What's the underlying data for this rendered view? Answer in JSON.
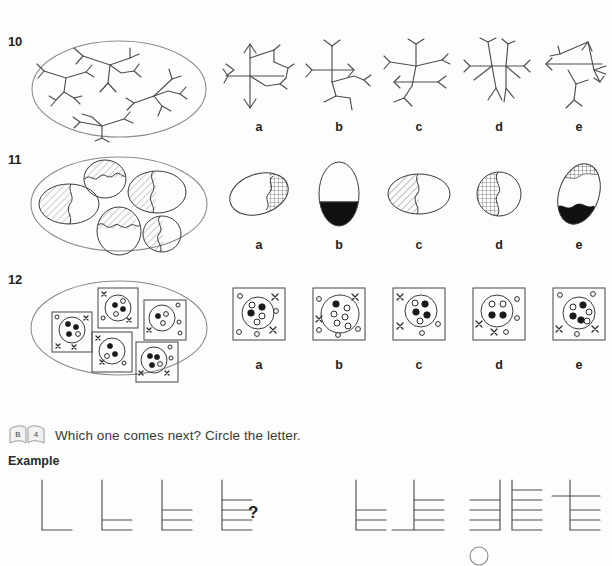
{
  "page": {
    "background": "#fdfdfd",
    "ink": "#3b3b3b"
  },
  "questions": [
    {
      "number": "10",
      "stimulus": {
        "shape": "ellipse",
        "description": "five branching stick / tree figures inside an oval"
      },
      "options": [
        {
          "label": "a",
          "description": "branching stick figure with arrow heads up and down on vertical stem"
        },
        {
          "label": "b",
          "description": "branching stick figure, no arrow heads"
        },
        {
          "label": "c",
          "description": "branching stick figure with one leftward arrow head"
        },
        {
          "label": "d",
          "description": "branching stick figure, no arrow heads"
        },
        {
          "label": "e",
          "description": "branching stick figure with several arrow heads"
        }
      ]
    },
    {
      "number": "11",
      "stimulus": {
        "shape": "ellipse",
        "description": "five ovals each split by a wavy line with one part cross-hatched"
      },
      "options": [
        {
          "label": "a",
          "description": "oval, small cross-hatched right section, wavy divide"
        },
        {
          "label": "b",
          "description": "oval, lower portion solid black, straight divide"
        },
        {
          "label": "c",
          "description": "oval, left portion diagonally hatched, wavy divide"
        },
        {
          "label": "d",
          "description": "circle, left portion cross-hatched, curved divide"
        },
        {
          "label": "e",
          "description": "oval, cross-hatched top and solid black bottom"
        }
      ]
    },
    {
      "number": "12",
      "stimulus": {
        "shape": "ellipse",
        "description": "five squares each containing a circle with filled and open dots plus x marks"
      },
      "options": [
        {
          "label": "a",
          "description": "square, circle with 2 filled and 3 open dots, x marks outside"
        },
        {
          "label": "b",
          "description": "square, large circle with 1 filled and 5 open dots, x marks outside"
        },
        {
          "label": "c",
          "description": "square, circle with 3 filled and 2 open dots, x marks outside"
        },
        {
          "label": "d",
          "description": "square, circle with 2 filled and 2 open dots, x marks outside"
        },
        {
          "label": "e",
          "description": "square, circle with 3 filled and 3 open dots, x marks outside"
        }
      ]
    }
  ],
  "section": {
    "badge": {
      "left_page": "B",
      "right_page": "4",
      "icon": "open-book-icon"
    },
    "instruction": "Which one comes next? Circle the letter.",
    "example_label": "Example",
    "question_mark": "?",
    "sequence": {
      "description": "vertical stem with horizontal bars added from the bottom up",
      "bars": [
        1,
        2,
        3,
        4
      ]
    },
    "example_options": [
      {
        "label": "a",
        "bars": 3,
        "side": "right",
        "stem": "plain"
      },
      {
        "label": "b",
        "bars": 4,
        "side": "right",
        "stem": "foot"
      },
      {
        "label": "c",
        "bars": 4,
        "side": "left",
        "stem": "plain"
      },
      {
        "label": "d",
        "bars": 5,
        "side": "right",
        "stem": "plain"
      },
      {
        "label": "e",
        "bars": 4,
        "side": "both",
        "stem": "plain"
      }
    ],
    "circled_answer": "d"
  }
}
